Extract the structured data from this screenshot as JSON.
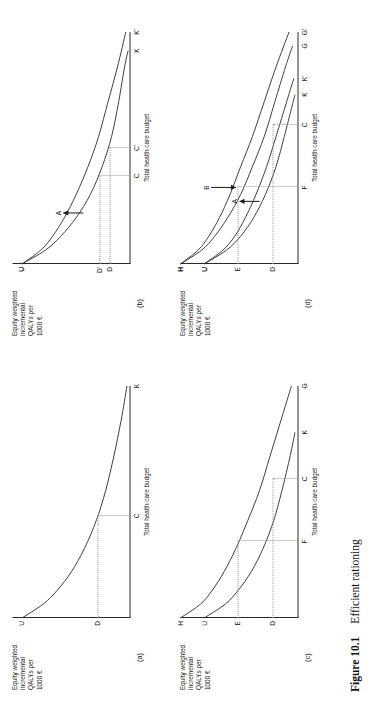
{
  "figure": {
    "caption_number": "Figure 10.1",
    "caption_title": "Efficient rationing"
  },
  "axis_labels": {
    "y_line1": "Equity weighted",
    "y_line2": "incremental",
    "y_line3": "QALYs per",
    "y_line4": "1000 €",
    "x": "Total health care budget"
  },
  "panels": {
    "a": {
      "tag": "(a)",
      "y_ticks": [
        "U",
        "D"
      ],
      "x_ticks": [
        "C",
        "K"
      ],
      "arrow_labels": []
    },
    "b": {
      "tag": "(b)",
      "y_ticks": [
        "U",
        "D'",
        "D"
      ],
      "x_ticks": [
        "C",
        "C'",
        "K",
        "K'"
      ],
      "arrow_labels": [
        "A"
      ]
    },
    "c": {
      "tag": "(c)",
      "y_ticks": [
        "H",
        "U",
        "E",
        "D"
      ],
      "x_ticks": [
        "F",
        "C",
        "K",
        "G"
      ],
      "arrow_labels": []
    },
    "d": {
      "tag": "(d)",
      "y_ticks": [
        "H",
        "U",
        "E",
        "D"
      ],
      "x_ticks": [
        "F",
        "C",
        "K",
        "K'",
        "G",
        "G'"
      ],
      "arrow_labels": [
        "A",
        "B"
      ]
    }
  },
  "chart_data": {
    "type": "line",
    "title": "Efficient rationing",
    "xlabel": "Total health care budget",
    "ylabel": "Equity weighted incremental QALYs per 1000 €",
    "grid": false,
    "legend": "none",
    "xlim": [
      0,
      1
    ],
    "ylim": [
      0,
      1
    ],
    "panels": [
      {
        "id": "a",
        "tag": "(a)",
        "series": [
          {
            "name": "UK",
            "start_label": "U",
            "end_label": "K",
            "x": [
              0.0,
              0.06,
              0.12,
              0.2,
              0.3,
              0.42,
              0.55,
              0.7,
              0.85,
              1.0
            ],
            "y": [
              0.92,
              0.74,
              0.62,
              0.5,
              0.39,
              0.29,
              0.21,
              0.14,
              0.08,
              0.03
            ]
          }
        ],
        "reference_lines": [
          {
            "kind": "horizontal",
            "y_label": "D",
            "y": 0.28,
            "x_to": 0.44
          },
          {
            "kind": "vertical",
            "x_label": "C",
            "x": 0.44,
            "y_to": 0.28
          }
        ]
      },
      {
        "id": "b",
        "tag": "(b)",
        "series": [
          {
            "name": "UK'",
            "start_label": "U",
            "end_label": "K'",
            "x": [
              0.0,
              0.06,
              0.12,
              0.2,
              0.3,
              0.42,
              0.55,
              0.7,
              0.85,
              1.0
            ],
            "y": [
              0.92,
              0.76,
              0.66,
              0.56,
              0.46,
              0.36,
              0.27,
              0.19,
              0.11,
              0.04
            ]
          },
          {
            "name": "UK",
            "start_label": "U",
            "end_label": "K",
            "x": [
              0.0,
              0.06,
              0.12,
              0.2,
              0.3,
              0.42,
              0.55,
              0.7,
              0.85,
              0.92
            ],
            "y": [
              0.92,
              0.72,
              0.59,
              0.46,
              0.34,
              0.24,
              0.16,
              0.1,
              0.05,
              0.02
            ]
          }
        ],
        "reference_lines": [
          {
            "kind": "horizontal",
            "y_label": "D",
            "y": 0.18,
            "x_to": 0.5
          },
          {
            "kind": "horizontal",
            "y_label": "D'",
            "y": 0.26,
            "x_to": 0.38
          },
          {
            "kind": "vertical",
            "x_label": "C",
            "x": 0.38,
            "y_to": 0.26
          },
          {
            "kind": "vertical",
            "x_label": "C'",
            "x": 0.5,
            "y_to": 0.18
          }
        ],
        "annotations": [
          {
            "label": "A",
            "type": "arrow",
            "x": 0.22,
            "y_from": 0.4,
            "y_to": 0.57
          }
        ]
      },
      {
        "id": "c",
        "tag": "(c)",
        "series": [
          {
            "name": "HG",
            "start_label": "H",
            "end_label": "G",
            "x": [
              0.0,
              0.06,
              0.12,
              0.2,
              0.3,
              0.42,
              0.55,
              0.7,
              0.85,
              1.0
            ],
            "y": [
              1.0,
              0.83,
              0.73,
              0.63,
              0.53,
              0.43,
              0.33,
              0.24,
              0.15,
              0.06
            ]
          },
          {
            "name": "UK",
            "start_label": "U",
            "end_label": "K",
            "x": [
              0.0,
              0.06,
              0.12,
              0.2,
              0.3,
              0.42,
              0.55,
              0.7,
              0.8
            ],
            "y": [
              0.8,
              0.62,
              0.51,
              0.4,
              0.3,
              0.21,
              0.14,
              0.07,
              0.03
            ]
          }
        ],
        "reference_lines": [
          {
            "kind": "horizontal",
            "y_label": "E",
            "y": 0.52,
            "x_to": 0.33
          },
          {
            "kind": "horizontal",
            "y_label": "D",
            "y": 0.22,
            "x_to": 0.6
          },
          {
            "kind": "vertical",
            "x_label": "F",
            "x": 0.33,
            "y_to": 0.52
          },
          {
            "kind": "vertical",
            "x_label": "C",
            "x": 0.6,
            "y_to": 0.22
          }
        ]
      },
      {
        "id": "d",
        "tag": "(d)",
        "series": [
          {
            "name": "HG'",
            "start_label": "H",
            "end_label": "G'",
            "x": [
              0.0,
              0.06,
              0.12,
              0.2,
              0.3,
              0.42,
              0.55,
              0.7,
              0.85,
              1.0
            ],
            "y": [
              1.0,
              0.85,
              0.76,
              0.67,
              0.58,
              0.49,
              0.39,
              0.29,
              0.19,
              0.08
            ]
          },
          {
            "name": "HG",
            "start_label": "H",
            "end_label": "G",
            "x": [
              0.0,
              0.06,
              0.12,
              0.2,
              0.3,
              0.42,
              0.55,
              0.7,
              0.85,
              0.94
            ],
            "y": [
              1.0,
              0.82,
              0.71,
              0.6,
              0.49,
              0.39,
              0.29,
              0.2,
              0.11,
              0.05
            ]
          },
          {
            "name": "UK'",
            "start_label": "U",
            "end_label": "K'",
            "x": [
              0.0,
              0.06,
              0.12,
              0.2,
              0.3,
              0.42,
              0.55,
              0.7,
              0.8
            ],
            "y": [
              0.8,
              0.64,
              0.54,
              0.45,
              0.36,
              0.27,
              0.19,
              0.1,
              0.04
            ]
          },
          {
            "name": "UK",
            "start_label": "U",
            "end_label": "K",
            "x": [
              0.0,
              0.06,
              0.12,
              0.2,
              0.3,
              0.42,
              0.55,
              0.67,
              0.73
            ],
            "y": [
              0.8,
              0.61,
              0.49,
              0.38,
              0.28,
              0.19,
              0.12,
              0.06,
              0.03
            ]
          }
        ],
        "reference_lines": [
          {
            "kind": "horizontal",
            "y_label": "E",
            "y": 0.52,
            "x_to": 0.33
          },
          {
            "kind": "horizontal",
            "y_label": "D",
            "y": 0.22,
            "x_to": 0.6
          },
          {
            "kind": "vertical",
            "x_label": "F",
            "x": 0.33,
            "y_to": 0.52
          },
          {
            "kind": "vertical",
            "x_label": "C",
            "x": 0.6,
            "y_to": 0.22
          }
        ],
        "annotations": [
          {
            "label": "A",
            "type": "arrow",
            "x": 0.27,
            "y_from": 0.33,
            "y_to": 0.5
          },
          {
            "label": "B",
            "type": "arrow",
            "x": 0.33,
            "y_from": 0.74,
            "y_to": 0.53
          }
        ]
      }
    ]
  }
}
